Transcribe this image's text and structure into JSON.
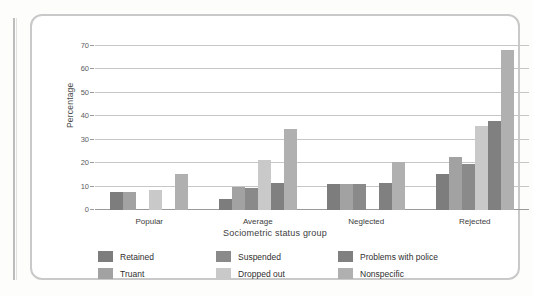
{
  "figure": {
    "frame": "rounded-panel"
  },
  "chart_data": {
    "type": "bar",
    "title": "",
    "xlabel": "Sociometric status group",
    "ylabel": "Percentage",
    "categories": [
      "Popular",
      "Average",
      "Neglected",
      "Rejected"
    ],
    "ylim": [
      0,
      70
    ],
    "yticks": [
      0,
      10,
      20,
      30,
      40,
      50,
      60,
      70
    ],
    "ytick_labels": [
      "0",
      "10",
      "20",
      "30",
      "40",
      "50",
      "60",
      "70"
    ],
    "grid": true,
    "legend_position": "below",
    "legend_columns": 3,
    "series": [
      {
        "name": "Retained",
        "color": "#7d7d7d",
        "values": [
          7.5,
          4.5,
          11.0,
          15.5
        ]
      },
      {
        "name": "Truant",
        "color": "#a2a2a2",
        "values": [
          7.5,
          10.0,
          11.0,
          22.5
        ]
      },
      {
        "name": "Suspended",
        "color": "#8a8a8a",
        "values": [
          0,
          9.5,
          11.0,
          19.5
        ]
      },
      {
        "name": "Dropped out",
        "color": "#c9c9c9",
        "values": [
          8.5,
          21.5,
          0,
          36.0
        ]
      },
      {
        "name": "Problems with police",
        "color": "#808080",
        "values": [
          0,
          11.5,
          11.5,
          38.0
        ]
      },
      {
        "name": "Nonspecific",
        "color": "#b0b0b0",
        "values": [
          15.5,
          34.5,
          20.5,
          68.5
        ]
      }
    ]
  },
  "legend": {
    "items": [
      {
        "label": "Retained",
        "color": "#7d7d7d"
      },
      {
        "label": "Suspended",
        "color": "#8a8a8a"
      },
      {
        "label": "Problems with police",
        "color": "#808080"
      },
      {
        "label": "Truant",
        "color": "#a2a2a2"
      },
      {
        "label": "Dropped out",
        "color": "#c9c9c9"
      },
      {
        "label": "Nonspecific",
        "color": "#b0b0b0"
      }
    ]
  }
}
